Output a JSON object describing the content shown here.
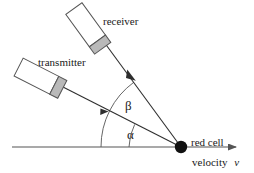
{
  "figure": {
    "background_color": "#ffffff",
    "line_color": "#3a3a3a",
    "axis_color": "#555555",
    "probe_body_color": "#ffffff",
    "probe_tip_color": "#b9b9b9",
    "cell_color": "#111111"
  },
  "labels": {
    "receiver": "receiver",
    "transmitter": "transmitter",
    "red_cell": "red cell",
    "velocity_text": "velocity",
    "velocity_symbol": "v",
    "angle_beta": "β",
    "angle_alpha": "α"
  },
  "geometry": {
    "red_cell_point": {
      "x": 181,
      "y": 147
    },
    "red_cell_radius": 6,
    "axis_line": {
      "x1": 12,
      "y1": 147,
      "x2": 243,
      "y2": 147
    },
    "transmitter_beam": {
      "x1": 61,
      "y1": 86,
      "x2": 181,
      "y2": 147
    },
    "receiver_beam": {
      "x1": 104,
      "y1": 42,
      "x2": 181,
      "y2": 147
    },
    "alpha_arc_radius": 52,
    "beta_arc_radius": 80,
    "alpha_degrees": 27,
    "beta_degrees": 54,
    "transmitter_probe": {
      "cx": 40,
      "cy": 78,
      "w": 44,
      "h": 20,
      "rotation": 27
    },
    "receiver_probe": {
      "cx": 88,
      "cy": 28,
      "w": 44,
      "h": 20,
      "rotation": 54
    }
  }
}
